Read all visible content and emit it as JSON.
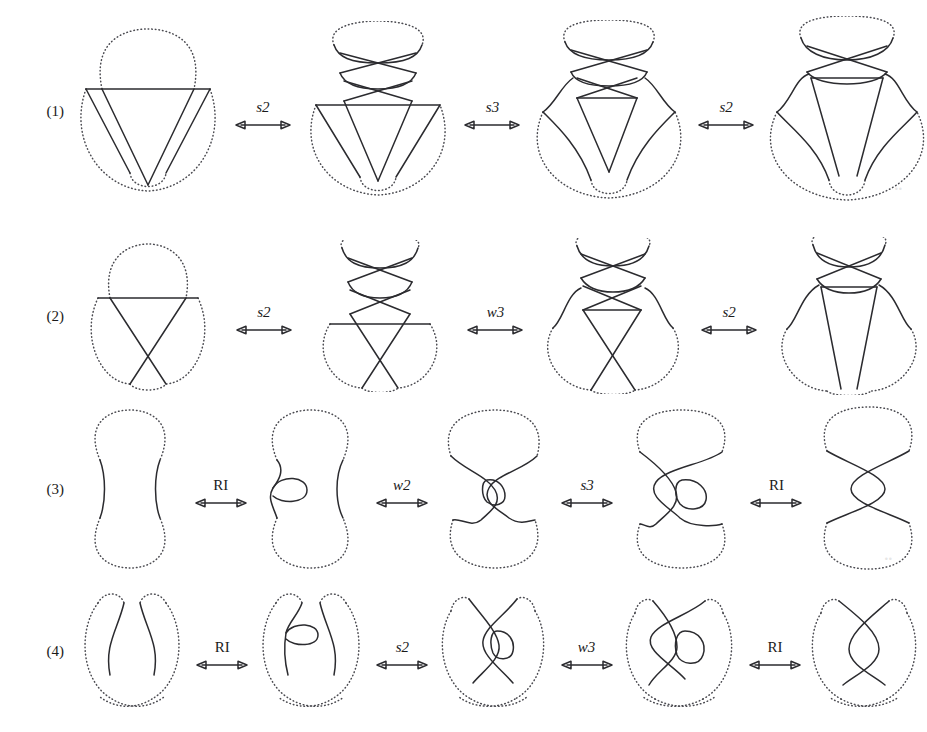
{
  "figure": {
    "background_color": "#ffffff",
    "solid_stroke_color": "#2b2b2f",
    "dotted_stroke_color": "#4a4a50",
    "rows": [
      {
        "label": "(1)",
        "diagrams": [
          {
            "name": "trefoil-shaded-a",
            "caption": "trefoil with horizontal chord"
          },
          {
            "name": "trefoil-shaded-b",
            "caption": "trefoil with twisted top lobe"
          },
          {
            "name": "trefoil-shaded-c",
            "caption": "trefoil with triangle and twisted top"
          },
          {
            "name": "trefoil-shaded-d",
            "caption": "trefoil with long parallel strands"
          }
        ],
        "arrows": [
          {
            "label": "s2",
            "style": "italic"
          },
          {
            "label": "s3",
            "style": "italic"
          },
          {
            "label": "s2",
            "style": "italic"
          }
        ]
      },
      {
        "label": "(2)",
        "diagrams": [
          {
            "name": "trefoil-narrow-a",
            "caption": "narrow trefoil with horizontal chord"
          },
          {
            "name": "trefoil-narrow-b",
            "caption": "narrow trefoil with twisted top lobe"
          },
          {
            "name": "trefoil-narrow-c",
            "caption": "narrow trefoil with triangle and twisted top"
          },
          {
            "name": "trefoil-narrow-d",
            "caption": "narrow trefoil with long parallel strands"
          }
        ],
        "arrows": [
          {
            "label": "s2",
            "style": "italic"
          },
          {
            "label": "w3",
            "style": "italic"
          },
          {
            "label": "s2",
            "style": "italic"
          }
        ]
      },
      {
        "label": "(3)",
        "diagrams": [
          {
            "name": "hourglass-a",
            "caption": "plain hourglass, no crossings"
          },
          {
            "name": "hourglass-b",
            "caption": "hourglass with small kink on left strand"
          },
          {
            "name": "hourglass-c",
            "caption": "hourglass with crossing and kink"
          },
          {
            "name": "hourglass-d",
            "caption": "hourglass with two crossings and kink"
          },
          {
            "name": "hourglass-e",
            "caption": "hourglass with two crossings, kink removed"
          }
        ],
        "arrows": [
          {
            "label": "RI",
            "style": "upright"
          },
          {
            "label": "w2",
            "style": "italic"
          },
          {
            "label": "s3",
            "style": "italic"
          },
          {
            "label": "RI",
            "style": "upright"
          }
        ]
      },
      {
        "label": "(4)",
        "diagrams": [
          {
            "name": "horseshoe-a",
            "caption": "plain horseshoe, no crossings"
          },
          {
            "name": "horseshoe-b",
            "caption": "horseshoe with small kink on left strand"
          },
          {
            "name": "horseshoe-c",
            "caption": "horseshoe with crossing and kink"
          },
          {
            "name": "horseshoe-d",
            "caption": "horseshoe with two crossings and kink"
          },
          {
            "name": "horseshoe-e",
            "caption": "horseshoe with two crossings, kink removed"
          }
        ],
        "arrows": [
          {
            "label": "RI",
            "style": "upright"
          },
          {
            "label": "s2",
            "style": "italic"
          },
          {
            "label": "w3",
            "style": "italic"
          },
          {
            "label": "RI",
            "style": "upright"
          }
        ]
      }
    ]
  }
}
